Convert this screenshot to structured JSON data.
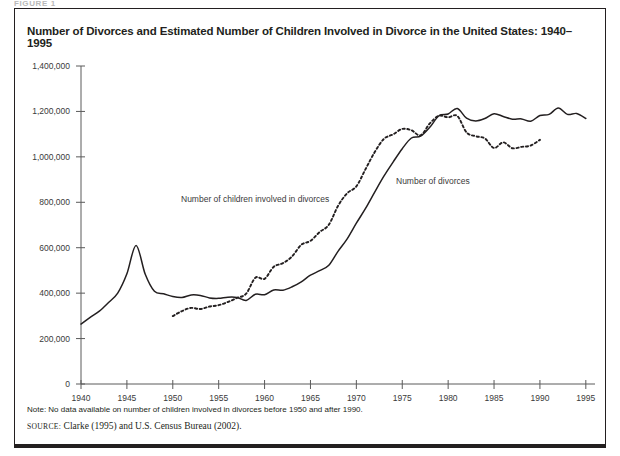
{
  "figure": {
    "label": "FIGURE 1",
    "title": "Number of Divorces and Estimated Number of Children Involved in Divorce in the United States: 1940–1995",
    "note": "Note: No data available on number of children involved in divorces before 1950 and after 1990.",
    "source_prefix": "source:",
    "source_text": "Clarke (1995) and U.S. Census Bureau (2002)."
  },
  "chart_data": {
    "type": "line",
    "title": "Number of Divorces and Estimated Number of Children Involved in Divorce in the United States: 1940–1995",
    "xlabel": "",
    "ylabel": "",
    "xlim": [
      1940,
      1996
    ],
    "ylim": [
      0,
      1400000
    ],
    "xticks": [
      1940,
      1945,
      1950,
      1955,
      1960,
      1965,
      1970,
      1975,
      1980,
      1985,
      1990,
      1995
    ],
    "xticklabels": [
      "1940",
      "1945",
      "1950",
      "1955",
      "1960",
      "1965",
      "1970",
      "1975",
      "1980",
      "1985",
      "1990",
      "1995"
    ],
    "yticks": [
      0,
      200000,
      400000,
      600000,
      800000,
      1000000,
      1200000,
      1400000
    ],
    "yticklabels": [
      "0",
      "200,000",
      "400,000",
      "600,000",
      "800,000",
      "1,000,000",
      "1,200,000",
      "1,400,000"
    ],
    "grid": false,
    "legend": "inline-annotations",
    "series": [
      {
        "name": "Number of divorces",
        "style": "solid",
        "color": "#231f20",
        "annotation": "Number of divorces",
        "x": [
          1940,
          1941,
          1942,
          1943,
          1944,
          1945,
          1946,
          1947,
          1948,
          1949,
          1950,
          1951,
          1952,
          1953,
          1954,
          1955,
          1956,
          1957,
          1958,
          1959,
          1960,
          1961,
          1962,
          1963,
          1964,
          1965,
          1966,
          1967,
          1968,
          1969,
          1970,
          1971,
          1972,
          1973,
          1974,
          1975,
          1976,
          1977,
          1978,
          1979,
          1980,
          1981,
          1982,
          1983,
          1984,
          1985,
          1986,
          1987,
          1988,
          1989,
          1990,
          1991,
          1992,
          1993,
          1994,
          1995
        ],
        "y": [
          264000,
          293000,
          321000,
          359000,
          400000,
          485000,
          610000,
          483000,
          408000,
          397000,
          385000,
          381000,
          392000,
          390000,
          379000,
          377000,
          382000,
          381000,
          368000,
          395000,
          393000,
          414000,
          413000,
          428000,
          450000,
          479000,
          499000,
          523000,
          584000,
          639000,
          708000,
          773000,
          845000,
          915000,
          977000,
          1036000,
          1083000,
          1091000,
          1130000,
          1181000,
          1189000,
          1213000,
          1170000,
          1158000,
          1169000,
          1190000,
          1178000,
          1166000,
          1167000,
          1157000,
          1182000,
          1187000,
          1215000,
          1187000,
          1191000,
          1169000
        ]
      },
      {
        "name": "Number of children involved in divorces",
        "style": "dotted",
        "color": "#231f20",
        "annotation": "Number of children involved in divorces",
        "x": [
          1950,
          1951,
          1952,
          1953,
          1954,
          1955,
          1956,
          1957,
          1958,
          1959,
          1960,
          1961,
          1962,
          1963,
          1964,
          1965,
          1966,
          1967,
          1968,
          1969,
          1970,
          1971,
          1972,
          1973,
          1974,
          1975,
          1976,
          1977,
          1978,
          1979,
          1980,
          1981,
          1982,
          1983,
          1984,
          1985,
          1986,
          1987,
          1988,
          1989,
          1990
        ],
        "y": [
          299000,
          321000,
          335000,
          330000,
          341000,
          347000,
          361000,
          379000,
          398000,
          468000,
          463000,
          516000,
          532000,
          562000,
          613000,
          630000,
          669000,
          701000,
          784000,
          840000,
          870000,
          946000,
          1021000,
          1079000,
          1099000,
          1123000,
          1117000,
          1095000,
          1147000,
          1181000,
          1174000,
          1180000,
          1108000,
          1091000,
          1081000,
          1039000,
          1064000,
          1038000,
          1044000,
          1050000,
          1075000
        ]
      }
    ]
  },
  "axis": {
    "ytick_labels": [
      "1,400,000",
      "1,200,000",
      "1,000,000",
      "800,000",
      "600,000",
      "400,000",
      "200,000",
      "0"
    ],
    "xtick_labels": [
      "1940",
      "1945",
      "1950",
      "1955",
      "1960",
      "1965",
      "1970",
      "1975",
      "1980",
      "1985",
      "1990",
      "1995"
    ]
  }
}
